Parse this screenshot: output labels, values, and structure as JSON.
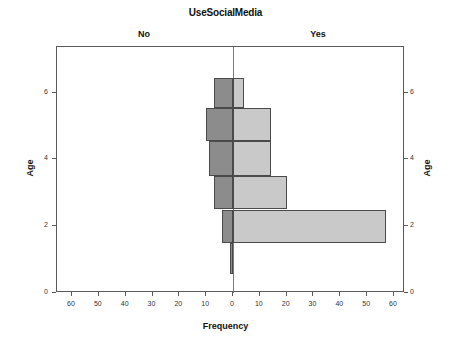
{
  "chart_data": {
    "type": "bar",
    "orientation": "horizontal",
    "layout": "population-pyramid",
    "title": "UseSocialMedia",
    "xlabel": "Frequency",
    "ylabel": "Age",
    "ylabel_right": "Age",
    "panels": [
      {
        "key": "no",
        "label": "No",
        "color": "#8c8c8c",
        "side": "left"
      },
      {
        "key": "yes",
        "label": "Yes",
        "color": "#c9c9c9",
        "side": "right"
      }
    ],
    "categories": [
      1,
      2,
      3,
      4,
      5,
      6
    ],
    "series": [
      {
        "name": "No",
        "values": [
          0,
          4,
          7,
          9,
          10,
          7
        ]
      },
      {
        "name": "Yes",
        "values": [
          0,
          57,
          20,
          14,
          14,
          4
        ]
      }
    ],
    "bars": [
      {
        "age": 6,
        "side": "no",
        "value": 7,
        "y_top": 6.45,
        "y_bottom": 5.55
      },
      {
        "age": 6,
        "side": "yes",
        "value": 4,
        "y_top": 6.45,
        "y_bottom": 5.55
      },
      {
        "age": 5,
        "side": "no",
        "value": 10,
        "y_top": 5.55,
        "y_bottom": 4.55
      },
      {
        "age": 5,
        "side": "yes",
        "value": 14,
        "y_top": 5.55,
        "y_bottom": 4.55
      },
      {
        "age": 4,
        "side": "no",
        "value": 9,
        "y_top": 4.55,
        "y_bottom": 3.5
      },
      {
        "age": 4,
        "side": "yes",
        "value": 14,
        "y_top": 4.55,
        "y_bottom": 3.5
      },
      {
        "age": 3,
        "side": "no",
        "value": 7,
        "y_top": 3.5,
        "y_bottom": 2.5
      },
      {
        "age": 3,
        "side": "yes",
        "value": 20,
        "y_top": 3.5,
        "y_bottom": 2.5
      },
      {
        "age": 2,
        "side": "no",
        "value": 4,
        "y_top": 2.5,
        "y_bottom": 1.5
      },
      {
        "age": 2,
        "side": "yes",
        "value": 57,
        "y_top": 2.5,
        "y_bottom": 1.5
      },
      {
        "age": 1,
        "side": "no",
        "value": 1,
        "y_top": 1.5,
        "y_bottom": 0.58
      }
    ],
    "xticks_left": [
      60,
      50,
      40,
      30,
      20,
      10,
      0
    ],
    "xticks_right": [
      10,
      20,
      30,
      40,
      50,
      60
    ],
    "xlim": [
      0,
      65
    ],
    "yticks": [
      0,
      2,
      4,
      6
    ],
    "ylim": [
      0,
      7.3
    ],
    "grid": false,
    "legend": "none"
  }
}
